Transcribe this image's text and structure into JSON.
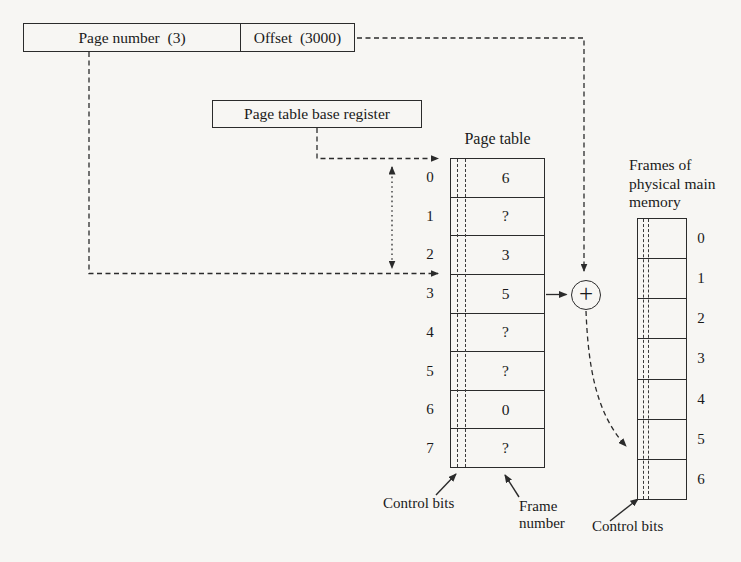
{
  "colors": {
    "ink": "#2b2b2b",
    "paper": "#f7f6f3"
  },
  "virtual_address": {
    "page_number_label": "Page number  (3)",
    "offset_label": "Offset  (3000)"
  },
  "page_table_base_register_label": "Page table base register",
  "page_table": {
    "title": "Page table",
    "rows": [
      {
        "index": "0",
        "value": "6"
      },
      {
        "index": "1",
        "value": "?"
      },
      {
        "index": "2",
        "value": "3"
      },
      {
        "index": "3",
        "value": "5"
      },
      {
        "index": "4",
        "value": "?"
      },
      {
        "index": "5",
        "value": "?"
      },
      {
        "index": "6",
        "value": "0"
      },
      {
        "index": "7",
        "value": "?"
      }
    ],
    "control_bits_label": "Control bits",
    "frame_number_label": [
      "Frame",
      "number"
    ]
  },
  "adder": {
    "symbol": "+"
  },
  "physical_memory": {
    "title_lines": [
      "Frames of",
      "physical main",
      "memory"
    ],
    "frame_indices": [
      "0",
      "1",
      "2",
      "3",
      "4",
      "5",
      "6"
    ],
    "control_bits_label": "Control bits"
  }
}
